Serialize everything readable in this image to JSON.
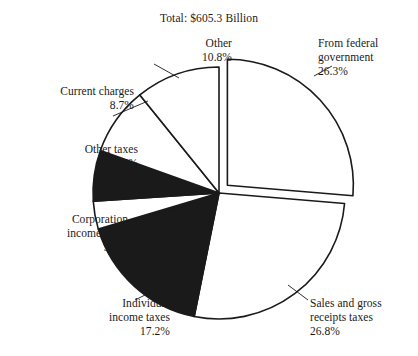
{
  "chart_data": {
    "type": "pie",
    "title": "Total: $605.3 Billion",
    "xlabel": "",
    "ylabel": "",
    "legend_position": "none",
    "grid": false,
    "start_angle_deg": 0,
    "direction": "clockwise",
    "total_label": "Total: $605.3 Billion",
    "total_value": 605.3,
    "total_units": "Billion USD",
    "categories": [
      "From federal government",
      "Sales and gross receipts taxes",
      "Individual income taxes",
      "Corporation income taxes",
      "Other taxes",
      "Current charges",
      "Other"
    ],
    "values": [
      26.3,
      26.8,
      17.2,
      3.6,
      6.5,
      8.7,
      10.8
    ],
    "value_suffix": "%",
    "slices": [
      {
        "id": "from-federal-government",
        "label_lines": [
          "From federal",
          "government"
        ],
        "value_text": "26.3%",
        "value": 26.3,
        "fill": "#ffffff",
        "stroke": "#1a1a1a",
        "exploded": true,
        "label_align": "left",
        "label_x": 318,
        "label_y": 36,
        "leader": {
          "x1": 314,
          "y1": 76,
          "x2": 332,
          "y2": 66
        }
      },
      {
        "id": "sales-and-gross-receipts-taxes",
        "label_lines": [
          "Sales and gross",
          "receipts taxes"
        ],
        "value_text": "26.8%",
        "value": 26.8,
        "fill": "#ffffff",
        "stroke": "#1a1a1a",
        "exploded": false,
        "label_align": "left",
        "label_x": 310,
        "label_y": 296,
        "leader": {
          "x1": 288,
          "y1": 285,
          "x2": 308,
          "y2": 300
        }
      },
      {
        "id": "individual-income-taxes",
        "label_lines": [
          "Individual",
          "income taxes"
        ],
        "value_text": "17.2%",
        "value": 17.2,
        "fill": "#1a1a1a",
        "stroke": "#1a1a1a",
        "exploded": false,
        "label_align": "right",
        "label_x": 60,
        "label_y": 296,
        "leader": {
          "x1": 153,
          "y1": 291,
          "x2": 135,
          "y2": 300
        }
      },
      {
        "id": "corporation-income-taxes",
        "label_lines": [
          "Corporation",
          "income taxes"
        ],
        "value_text": "3.6%",
        "value": 3.6,
        "fill": "#ffffff",
        "stroke": "#1a1a1a",
        "exploded": false,
        "label_align": "right",
        "label_x": 18,
        "label_y": 212,
        "leader": {
          "x1": 192,
          "y1": 204,
          "x2": 127,
          "y2": 221
        }
      },
      {
        "id": "other-taxes",
        "label_lines": [
          "Other taxes"
        ],
        "value_text": "6.5%",
        "value": 6.5,
        "fill": "#1a1a1a",
        "stroke": "#1a1a1a",
        "exploded": false,
        "label_align": "right",
        "label_x": 28,
        "label_y": 142,
        "leader": {
          "x1": 123,
          "y1": 172,
          "x2": 97,
          "y2": 160
        }
      },
      {
        "id": "current-charges",
        "label_lines": [
          "Current charges"
        ],
        "value_text": "8.7%",
        "value": 8.7,
        "fill": "#ffffff",
        "stroke": "#1a1a1a",
        "exploded": false,
        "label_align": "right",
        "label_x": 24,
        "label_y": 84,
        "leader": {
          "x1": 148,
          "y1": 101,
          "x2": 113,
          "y2": 116
        }
      },
      {
        "id": "other",
        "label_lines": [
          "Other"
        ],
        "value_text": "10.8%",
        "value": 10.8,
        "fill": "#ffffff",
        "stroke": "#1a1a1a",
        "exploded": false,
        "label_align": "right",
        "label_x": 122,
        "label_y": 36,
        "leader": {
          "x1": 179,
          "y1": 78,
          "x2": 154,
          "y2": 64
        }
      }
    ],
    "geometry": {
      "center_x": 219,
      "center_y": 193,
      "radius": 126,
      "explode_offset_x": 9,
      "explode_offset_y": -7
    },
    "colors": {
      "ink": "#1a1a1a",
      "paper": "#ffffff",
      "filled_slice": "#1a1a1a",
      "empty_slice": "#ffffff"
    }
  }
}
